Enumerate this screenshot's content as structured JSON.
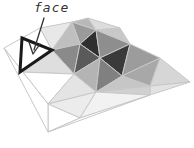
{
  "diagram": {
    "label": {
      "text": "face",
      "x": 34,
      "y": 0
    },
    "arrow": {
      "points": "44,18 34,50",
      "head": "29,42 33,54 40,44",
      "color": "#333333"
    },
    "colors": {
      "edge": "#c8c8c8",
      "highlight_edge": "#1a1a1a",
      "white": "#ffffff",
      "light": "#e6e6e6",
      "mid_light": "#c4c4c4",
      "mid": "#a0a0a0",
      "mid_dark": "#808080",
      "dark": "#4a4a4a",
      "darkest": "#2e2e2e"
    },
    "faces": [
      {
        "points": "4,48 22,38 20,72",
        "fill": "#ffffff"
      },
      {
        "points": "22,38 40,28 52,50",
        "fill": "#ffffff"
      },
      {
        "points": "40,28 72,22 52,50",
        "fill": "#e8e8e8"
      },
      {
        "points": "72,22 88,18 96,30",
        "fill": "#b8b8b8"
      },
      {
        "points": "72,22 96,30 80,44",
        "fill": "#9a9a9a"
      },
      {
        "points": "52,50 72,22 80,44",
        "fill": "#bfbfbf"
      },
      {
        "points": "88,18 120,28 96,30",
        "fill": "#dcdcdc"
      },
      {
        "points": "96,30 120,28 130,44",
        "fill": "#c8c8c8"
      },
      {
        "points": "80,44 96,30 100,58",
        "fill": "#2f2f2f"
      },
      {
        "points": "96,30 130,44 100,58",
        "fill": "#8e8e8e"
      },
      {
        "points": "100,58 130,44 122,76",
        "fill": "#3a3a3a"
      },
      {
        "points": "130,44 160,58 122,76",
        "fill": "#9c9c9c"
      },
      {
        "points": "160,58 190,82 150,86",
        "fill": "#d6d6d6"
      },
      {
        "points": "122,76 160,58 150,86",
        "fill": "#a8a8a8"
      },
      {
        "points": "52,50 80,44 74,74",
        "fill": "#8a8a8a"
      },
      {
        "points": "80,44 100,58 74,74",
        "fill": "#5a5a5a"
      },
      {
        "points": "74,74 100,58 96,92",
        "fill": "#b4b4b4"
      },
      {
        "points": "100,58 122,76 96,92",
        "fill": "#808080"
      },
      {
        "points": "96,92 122,76 150,86",
        "fill": "#c6c6c6"
      },
      {
        "points": "150,86 190,82 150,95",
        "fill": "#e2e2e2"
      },
      {
        "points": "96,92 150,86 150,95",
        "fill": "#d0d0d0"
      },
      {
        "points": "20,72 52,50 74,74",
        "fill": "#dedede"
      },
      {
        "points": "20,72 74,74 48,104",
        "fill": "#ffffff"
      },
      {
        "points": "48,104 74,74 96,92",
        "fill": "#e4e4e4"
      },
      {
        "points": "48,104 96,92 80,118",
        "fill": "#ececec"
      },
      {
        "points": "48,104 80,118 48,132",
        "fill": "#ffffff"
      },
      {
        "points": "80,118 96,92 150,95",
        "fill": "#f2f2f2"
      },
      {
        "points": "48,132 80,118 150,95",
        "fill": "#ffffff"
      },
      {
        "points": "4,48 20,72 48,104",
        "fill": "#ffffff"
      },
      {
        "points": "4,48 48,104 48,132",
        "fill": "#ffffff"
      }
    ],
    "highlight_face": {
      "name": "face",
      "points": "22,38 52,50 20,72"
    }
  }
}
